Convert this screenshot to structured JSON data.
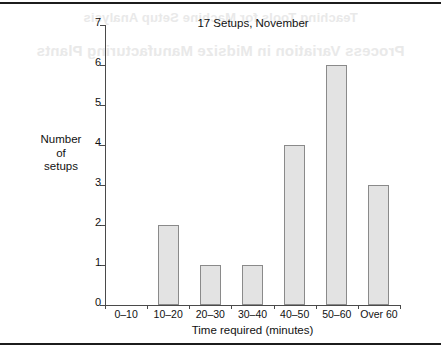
{
  "page": {
    "ghost_text_line1": "Teaching Tools for Machine Setup Analysis",
    "ghost_text_line2": "Process Variation in Midsize Manufacturing Plants"
  },
  "chart_data": {
    "type": "bar",
    "title": "17 Setups, November",
    "xlabel": "Time required (minutes)",
    "ylabel_lines": [
      "Number",
      "of",
      "setups"
    ],
    "categories": [
      "0–10",
      "10–20",
      "20–30",
      "30–40",
      "40–50",
      "50–60",
      "Over 60"
    ],
    "values": [
      0,
      2,
      1,
      1,
      4,
      6,
      3
    ],
    "ylim": [
      0,
      7
    ],
    "ytick_labels": [
      "0",
      "1",
      "2",
      "3",
      "4",
      "5",
      "6",
      "7"
    ],
    "ytick_values": [
      0,
      1,
      2,
      3,
      4,
      5,
      6,
      7
    ],
    "grid": false,
    "legend": null,
    "bar_fill_color": "#e3e3e3",
    "bar_border_color": "#8a8a8a",
    "axis_color": "#4a4a4a"
  }
}
